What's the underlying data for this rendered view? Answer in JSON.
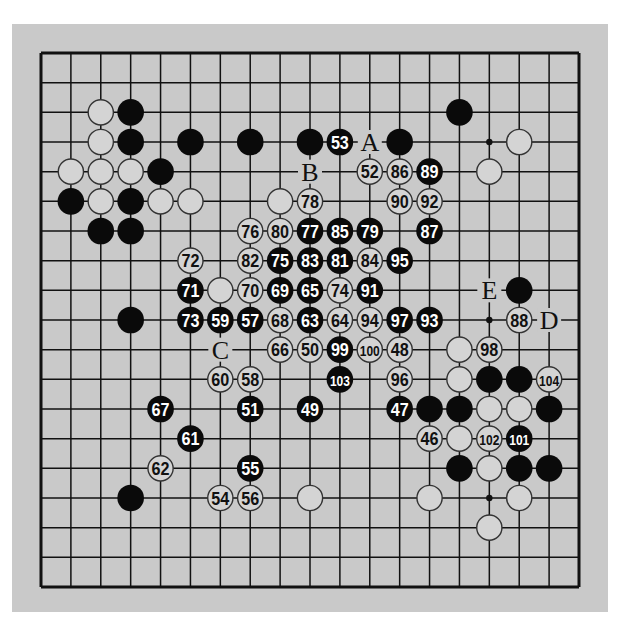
{
  "diagram": {
    "type": "go-board",
    "size": 19,
    "colors": {
      "panel": "#c9c9c9",
      "line": "#111111",
      "black_stone": "#0a0a0a",
      "white_stone_fill": "#d4d4d4",
      "white_stone_stroke": "#333333"
    },
    "star_points_visible": [
      [
        15,
        3
      ],
      [
        15,
        9
      ],
      [
        15,
        15
      ]
    ],
    "stones": {
      "black": [
        [
          3,
          2
        ],
        [
          3,
          3
        ],
        [
          5,
          3
        ],
        [
          7,
          3
        ],
        [
          9,
          3
        ],
        [
          12,
          3
        ],
        [
          14,
          2
        ],
        [
          4,
          4
        ],
        [
          1,
          5
        ],
        [
          3,
          5
        ],
        [
          2,
          6
        ],
        [
          3,
          6
        ],
        [
          3,
          9
        ],
        [
          16,
          8
        ],
        [
          15,
          11
        ],
        [
          16,
          11
        ],
        [
          13,
          12
        ],
        [
          14,
          12
        ],
        [
          17,
          12
        ],
        [
          14,
          14
        ],
        [
          16,
          14
        ],
        [
          17,
          14
        ],
        [
          3,
          15
        ]
      ],
      "white": [
        [
          2,
          2
        ],
        [
          2,
          3
        ],
        [
          16,
          3
        ],
        [
          1,
          4
        ],
        [
          2,
          4
        ],
        [
          3,
          4
        ],
        [
          15,
          4
        ],
        [
          2,
          5
        ],
        [
          4,
          5
        ],
        [
          5,
          5
        ],
        [
          8,
          5
        ],
        [
          6,
          8
        ],
        [
          14,
          10
        ],
        [
          14,
          11
        ],
        [
          15,
          12
        ],
        [
          16,
          12
        ],
        [
          14,
          13
        ],
        [
          15,
          14
        ],
        [
          9,
          15
        ],
        [
          13,
          15
        ],
        [
          16,
          15
        ],
        [
          15,
          16
        ]
      ]
    },
    "moves": [
      {
        "n": "46",
        "color": "white",
        "x": 13,
        "y": 13
      },
      {
        "n": "47",
        "color": "black",
        "x": 12,
        "y": 12
      },
      {
        "n": "48",
        "color": "white",
        "x": 12,
        "y": 10
      },
      {
        "n": "49",
        "color": "black",
        "x": 9,
        "y": 12
      },
      {
        "n": "50",
        "color": "white",
        "x": 9,
        "y": 10
      },
      {
        "n": "51",
        "color": "black",
        "x": 7,
        "y": 12
      },
      {
        "n": "52",
        "color": "white",
        "x": 11,
        "y": 4
      },
      {
        "n": "53",
        "color": "black",
        "x": 10,
        "y": 3
      },
      {
        "n": "54",
        "color": "white",
        "x": 6,
        "y": 15
      },
      {
        "n": "55",
        "color": "black",
        "x": 7,
        "y": 14
      },
      {
        "n": "56",
        "color": "white",
        "x": 7,
        "y": 15
      },
      {
        "n": "57",
        "color": "black",
        "x": 7,
        "y": 9
      },
      {
        "n": "58",
        "color": "white",
        "x": 7,
        "y": 11
      },
      {
        "n": "59",
        "color": "black",
        "x": 6,
        "y": 9
      },
      {
        "n": "60",
        "color": "white",
        "x": 6,
        "y": 11
      },
      {
        "n": "61",
        "color": "black",
        "x": 5,
        "y": 13
      },
      {
        "n": "62",
        "color": "white",
        "x": 4,
        "y": 14
      },
      {
        "n": "63",
        "color": "black",
        "x": 9,
        "y": 9
      },
      {
        "n": "64",
        "color": "white",
        "x": 10,
        "y": 9
      },
      {
        "n": "65",
        "color": "black",
        "x": 9,
        "y": 8
      },
      {
        "n": "66",
        "color": "white",
        "x": 8,
        "y": 10
      },
      {
        "n": "67",
        "color": "black",
        "x": 4,
        "y": 12
      },
      {
        "n": "68",
        "color": "white",
        "x": 8,
        "y": 9
      },
      {
        "n": "69",
        "color": "black",
        "x": 8,
        "y": 8
      },
      {
        "n": "70",
        "color": "white",
        "x": 7,
        "y": 8
      },
      {
        "n": "71",
        "color": "black",
        "x": 5,
        "y": 8
      },
      {
        "n": "72",
        "color": "white",
        "x": 5,
        "y": 7
      },
      {
        "n": "73",
        "color": "black",
        "x": 5,
        "y": 9
      },
      {
        "n": "74",
        "color": "white",
        "x": 10,
        "y": 8
      },
      {
        "n": "75",
        "color": "black",
        "x": 8,
        "y": 7
      },
      {
        "n": "76",
        "color": "white",
        "x": 7,
        "y": 6
      },
      {
        "n": "77",
        "color": "black",
        "x": 9,
        "y": 6
      },
      {
        "n": "78",
        "color": "white",
        "x": 9,
        "y": 5
      },
      {
        "n": "79",
        "color": "black",
        "x": 11,
        "y": 6
      },
      {
        "n": "80",
        "color": "white",
        "x": 8,
        "y": 6
      },
      {
        "n": "81",
        "color": "black",
        "x": 10,
        "y": 7
      },
      {
        "n": "82",
        "color": "white",
        "x": 7,
        "y": 7
      },
      {
        "n": "83",
        "color": "black",
        "x": 9,
        "y": 7
      },
      {
        "n": "84",
        "color": "white",
        "x": 11,
        "y": 7
      },
      {
        "n": "85",
        "color": "black",
        "x": 10,
        "y": 6
      },
      {
        "n": "86",
        "color": "white",
        "x": 12,
        "y": 4
      },
      {
        "n": "87",
        "color": "black",
        "x": 13,
        "y": 6
      },
      {
        "n": "88",
        "color": "white",
        "x": 16,
        "y": 9
      },
      {
        "n": "89",
        "color": "black",
        "x": 13,
        "y": 4
      },
      {
        "n": "90",
        "color": "white",
        "x": 12,
        "y": 5
      },
      {
        "n": "91",
        "color": "black",
        "x": 11,
        "y": 8
      },
      {
        "n": "92",
        "color": "white",
        "x": 13,
        "y": 5
      },
      {
        "n": "93",
        "color": "black",
        "x": 13,
        "y": 9
      },
      {
        "n": "94",
        "color": "white",
        "x": 11,
        "y": 9
      },
      {
        "n": "95",
        "color": "black",
        "x": 12,
        "y": 7
      },
      {
        "n": "96",
        "color": "white",
        "x": 12,
        "y": 11
      },
      {
        "n": "97",
        "color": "black",
        "x": 12,
        "y": 9
      },
      {
        "n": "98",
        "color": "white",
        "x": 15,
        "y": 10
      },
      {
        "n": "99",
        "color": "black",
        "x": 10,
        "y": 10
      },
      {
        "n": "100",
        "color": "white",
        "x": 11,
        "y": 10
      },
      {
        "n": "101",
        "color": "black",
        "x": 16,
        "y": 13
      },
      {
        "n": "102",
        "color": "white",
        "x": 15,
        "y": 13
      },
      {
        "n": "103",
        "color": "black",
        "x": 10,
        "y": 11
      },
      {
        "n": "104",
        "color": "white",
        "x": 17,
        "y": 11
      }
    ],
    "labels": [
      {
        "text": "A",
        "x": 11,
        "y": 3
      },
      {
        "text": "B",
        "x": 9,
        "y": 4
      },
      {
        "text": "C",
        "x": 6,
        "y": 10
      },
      {
        "text": "D",
        "x": 17,
        "y": 9
      },
      {
        "text": "E",
        "x": 15,
        "y": 8
      }
    ]
  }
}
